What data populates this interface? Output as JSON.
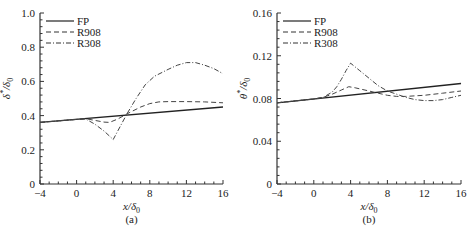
{
  "chart_data": [
    {
      "id": "a",
      "type": "line",
      "panel_label": "(a)",
      "xlabel": "x/δ0",
      "ylabel": "δ*/δ0",
      "xlim": [
        -4,
        16
      ],
      "ylim": [
        0,
        1.0
      ],
      "xticks": [
        -4,
        0,
        4,
        8,
        12,
        16
      ],
      "xtick_labels": [
        "−4",
        "0",
        "4",
        "8",
        "12",
        "16"
      ],
      "yticks": [
        0,
        0.2,
        0.4,
        0.6,
        0.8,
        1.0
      ],
      "ytick_labels": [
        "0",
        "0.2",
        "0.4",
        "0.6",
        "0.8",
        "1.0"
      ],
      "grid": false,
      "legend_position": "upper left",
      "series": [
        {
          "name": "FP",
          "style": "solid",
          "x": [
            -4,
            16
          ],
          "y": [
            0.36,
            0.45
          ]
        },
        {
          "name": "R908",
          "style": "dashed",
          "x": [
            -4,
            0,
            1,
            2,
            3,
            3.6,
            4.5,
            5.5,
            7,
            8,
            9,
            10,
            12,
            14,
            16
          ],
          "y": [
            0.36,
            0.378,
            0.382,
            0.372,
            0.362,
            0.36,
            0.38,
            0.41,
            0.45,
            0.47,
            0.48,
            0.482,
            0.482,
            0.48,
            0.475
          ]
        },
        {
          "name": "R308",
          "style": "dashdot",
          "x": [
            -4,
            0,
            1,
            2,
            3,
            4,
            4.8,
            5.5,
            6.5,
            7.5,
            8.5,
            10,
            11,
            12,
            13,
            14,
            15,
            16
          ],
          "y": [
            0.36,
            0.378,
            0.38,
            0.35,
            0.31,
            0.26,
            0.34,
            0.41,
            0.5,
            0.58,
            0.63,
            0.67,
            0.695,
            0.71,
            0.71,
            0.695,
            0.675,
            0.645
          ]
        }
      ]
    },
    {
      "id": "b",
      "type": "line",
      "panel_label": "(b)",
      "xlabel": "x/δ0",
      "ylabel": "θ*/δ0",
      "xlim": [
        -4,
        16
      ],
      "ylim": [
        0,
        0.16
      ],
      "xticks": [
        -4,
        0,
        4,
        8,
        12,
        16
      ],
      "xtick_labels": [
        "−4",
        "0",
        "4",
        "8",
        "12",
        "16"
      ],
      "yticks": [
        0,
        0.04,
        0.08,
        0.12,
        0.16
      ],
      "ytick_labels": [
        "0",
        "0.04",
        "0.08",
        "0.12",
        "0.16"
      ],
      "grid": false,
      "legend_position": "upper left",
      "series": [
        {
          "name": "FP",
          "style": "solid",
          "x": [
            -4,
            16
          ],
          "y": [
            0.076,
            0.094
          ]
        },
        {
          "name": "R908",
          "style": "dashed",
          "x": [
            -4,
            0,
            1,
            2,
            3,
            3.8,
            4.5,
            6,
            7,
            8,
            9,
            10,
            12,
            14,
            16
          ],
          "y": [
            0.076,
            0.0795,
            0.081,
            0.084,
            0.088,
            0.091,
            0.09,
            0.087,
            0.085,
            0.083,
            0.082,
            0.082,
            0.083,
            0.085,
            0.087
          ]
        },
        {
          "name": "R308",
          "style": "dashdot",
          "x": [
            -4,
            0,
            1,
            2,
            2.5,
            3,
            3.5,
            4,
            5,
            6,
            7,
            8,
            9,
            10,
            11,
            12,
            13,
            14,
            15,
            16
          ],
          "y": [
            0.076,
            0.0795,
            0.081,
            0.086,
            0.091,
            0.098,
            0.106,
            0.113,
            0.106,
            0.099,
            0.092,
            0.087,
            0.084,
            0.081,
            0.079,
            0.078,
            0.078,
            0.079,
            0.081,
            0.083
          ]
        }
      ]
    }
  ],
  "layout": {
    "panels": [
      {
        "left": 40,
        "right": 223,
        "top": 13,
        "bottom": 184
      },
      {
        "left": 277,
        "right": 461,
        "top": 13,
        "bottom": 184
      }
    ]
  }
}
